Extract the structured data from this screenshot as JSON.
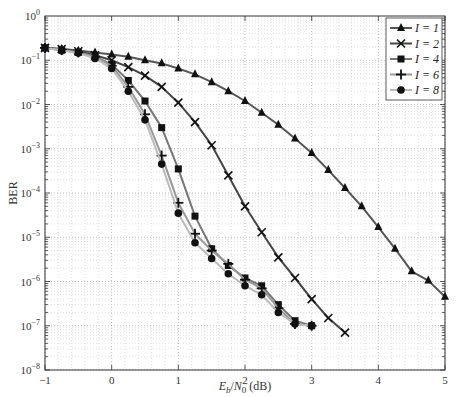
{
  "chart_data": {
    "type": "line",
    "title": "",
    "xlabel": "Eb/N0 (dB)",
    "xlabel_parts": {
      "E": "E",
      "b": "b",
      "slash": "/",
      "N": "N",
      "zero": "0",
      "unit": " (dB)"
    },
    "ylabel": "BER",
    "xlim": [
      -1,
      5
    ],
    "ylim": [
      1e-08,
      1
    ],
    "yscale": "log",
    "grid": true,
    "legend_position": "upper right",
    "xticks": [
      -1,
      0,
      1,
      2,
      3,
      4,
      5
    ],
    "xtick_labels": [
      "−1",
      "0",
      "1",
      "2",
      "3",
      "4",
      "5"
    ],
    "yticks_exp": [
      0,
      -1,
      -2,
      -3,
      -4,
      -5,
      -6,
      -7,
      -8
    ],
    "series": [
      {
        "name": "I = 1",
        "marker": "triangle",
        "color": "#555555",
        "x": [
          -1,
          -0.75,
          -0.5,
          -0.25,
          0,
          0.25,
          0.5,
          0.75,
          1,
          1.25,
          1.5,
          1.75,
          2,
          2.25,
          2.5,
          2.75,
          3,
          3.25,
          3.5,
          3.75,
          4,
          4.25,
          4.5,
          4.75,
          5
        ],
        "y": [
          0.19,
          0.18,
          0.165,
          0.15,
          0.135,
          0.12,
          0.1,
          0.085,
          0.065,
          0.048,
          0.032,
          0.02,
          0.012,
          0.0065,
          0.0035,
          0.0017,
          0.0008,
          0.00033,
          0.00013,
          5e-05,
          1.7e-05,
          5.5e-06,
          1.7e-06,
          1.05e-06,
          4.5e-07
        ]
      },
      {
        "name": "I = 2",
        "marker": "x",
        "color": "#444444",
        "x": [
          -1,
          -0.75,
          -0.5,
          -0.25,
          0,
          0.25,
          0.5,
          0.75,
          1,
          1.25,
          1.5,
          1.75,
          2,
          2.25,
          2.5,
          2.75,
          3,
          3.25,
          3.5
        ],
        "y": [
          0.19,
          0.18,
          0.16,
          0.13,
          0.1,
          0.07,
          0.045,
          0.025,
          0.011,
          0.004,
          0.0012,
          0.00025,
          5e-05,
          1.3e-05,
          3.5e-06,
          1.2e-06,
          4e-07,
          1.5e-07,
          7e-08
        ]
      },
      {
        "name": "I = 4",
        "marker": "square",
        "color": "#777777",
        "x": [
          -1,
          -0.75,
          -0.5,
          -0.25,
          0,
          0.25,
          0.5,
          0.75,
          1,
          1.25,
          1.5,
          1.75,
          2,
          2.25,
          2.5,
          2.75,
          3
        ],
        "y": [
          0.19,
          0.17,
          0.15,
          0.12,
          0.08,
          0.035,
          0.012,
          0.003,
          0.00035,
          3e-05,
          5.5e-06,
          2.3e-06,
          1.2e-06,
          8e-07,
          3e-07,
          1.3e-07,
          1e-07
        ]
      },
      {
        "name": "I = 6",
        "marker": "plus",
        "color": "#999999",
        "x": [
          -1,
          -0.75,
          -0.5,
          -0.25,
          0,
          0.25,
          0.5,
          0.75,
          1,
          1.25,
          1.5,
          1.75,
          2,
          2.25,
          2.5,
          2.75,
          3
        ],
        "y": [
          0.19,
          0.17,
          0.15,
          0.12,
          0.075,
          0.025,
          0.006,
          0.0007,
          6e-05,
          1.2e-05,
          5e-06,
          2.5e-06,
          1.1e-06,
          7e-07,
          2.5e-07,
          1.1e-07,
          1e-07
        ]
      },
      {
        "name": "I = 8",
        "marker": "circle",
        "color": "#bbbbbb",
        "x": [
          -1,
          -0.75,
          -0.5,
          -0.25,
          0,
          0.25,
          0.5,
          0.75,
          1,
          1.25,
          1.5,
          1.75,
          2,
          2.25,
          2.5,
          2.75,
          3
        ],
        "y": [
          0.19,
          0.165,
          0.145,
          0.11,
          0.065,
          0.02,
          0.0045,
          0.00045,
          3.5e-05,
          7.5e-06,
          3.3e-06,
          1.5e-06,
          8e-07,
          5e-07,
          2e-07,
          1.1e-07,
          1e-07
        ]
      }
    ]
  }
}
